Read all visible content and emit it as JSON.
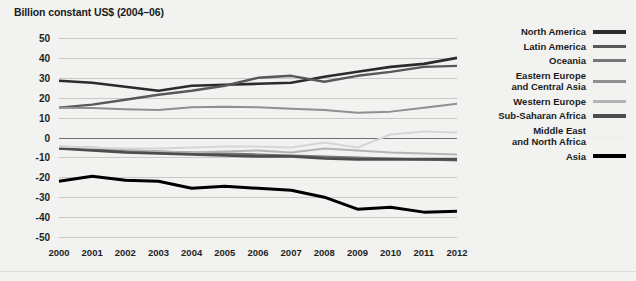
{
  "chart_data": {
    "type": "line",
    "title": "Billion constant US$ (2004–06)",
    "subtitle": "",
    "xlabel": "",
    "ylabel": "Billion constant US$ (2004–06)",
    "x": [
      2000,
      2001,
      2002,
      2003,
      2004,
      2005,
      2006,
      2007,
      2008,
      2009,
      2010,
      2011,
      2012
    ],
    "xtick_labels": [
      "2000",
      "2001",
      "2002",
      "2003",
      "2004",
      "2005",
      "2006",
      "2007",
      "2008",
      "2009",
      "2010",
      "2011",
      "2012"
    ],
    "ytick_labels": [
      "50",
      "40",
      "30",
      "20",
      "10",
      "0",
      "-10",
      "-20",
      "-30",
      "-40",
      "-50"
    ],
    "ytick_values": [
      50,
      40,
      30,
      20,
      10,
      0,
      -10,
      -20,
      -30,
      -40,
      -50
    ],
    "ylim": [
      -50,
      50
    ],
    "xlim": [
      2000,
      2012
    ],
    "grid": true,
    "legend_position": "right",
    "series": [
      {
        "name": "North America",
        "color": "#2b2b2b",
        "width": 2.6,
        "values": [
          28.5,
          27.5,
          25.5,
          23.5,
          26.0,
          26.5,
          27.0,
          27.5,
          30.5,
          33.0,
          35.5,
          37.0,
          40.0
        ]
      },
      {
        "name": "Latin America",
        "color": "#585858",
        "width": 2.4,
        "values": [
          15.0,
          16.5,
          19.0,
          21.5,
          23.5,
          26.0,
          30.0,
          31.0,
          28.0,
          31.0,
          33.0,
          35.5,
          36.0
        ]
      },
      {
        "name": "Oceania",
        "color": "#767676",
        "width": 2.0,
        "values": [
          -5.5,
          -6.0,
          -6.5,
          -7.0,
          -7.5,
          -8.0,
          -8.5,
          -9.0,
          -9.5,
          -10.0,
          -10.5,
          -11.0,
          -11.5
        ]
      },
      {
        "name": "Eastern Europe\nand Central Asia",
        "color": "#8f8f8f",
        "width": 2.0,
        "values": [
          15.0,
          14.8,
          14.2,
          13.8,
          15.2,
          15.5,
          15.2,
          14.5,
          13.8,
          12.5,
          13.0,
          15.0,
          17.0
        ]
      },
      {
        "name": "Western Europe",
        "color": "#b4b4b4",
        "width": 2.0,
        "values": [
          -4.5,
          -5.0,
          -6.0,
          -7.0,
          -7.5,
          -7.0,
          -6.5,
          -7.5,
          -5.5,
          -6.5,
          -7.5,
          -8.0,
          -8.5
        ]
      },
      {
        "name": "Sub-Saharan Africa",
        "color": "#4d4d4d",
        "width": 2.6,
        "values": [
          -5.5,
          -6.5,
          -7.5,
          -8.0,
          -8.5,
          -9.0,
          -9.5,
          -9.5,
          -10.5,
          -11.0,
          -11.0,
          -11.0,
          -11.0
        ]
      },
      {
        "name": "Middle East\nand North Africa",
        "color": "#d6d6d6",
        "width": 2.0,
        "values": [
          -4.5,
          -5.0,
          -5.5,
          -5.5,
          -5.0,
          -4.5,
          -4.5,
          -5.0,
          -2.5,
          -5.0,
          1.5,
          3.0,
          2.5
        ]
      },
      {
        "name": "Asia",
        "color": "#000000",
        "width": 3.0,
        "values": [
          -22.0,
          -19.5,
          -21.5,
          -22.0,
          -25.5,
          -24.5,
          -25.5,
          -26.5,
          -30.0,
          -36.0,
          -35.0,
          -37.5,
          -37.0
        ]
      }
    ]
  },
  "legend": {
    "entries": [
      {
        "label": "North America",
        "color": "#2b2b2b",
        "thick": true
      },
      {
        "label": "Latin America",
        "color": "#585858",
        "thick": false
      },
      {
        "label": "Oceania",
        "color": "#767676",
        "thick": false
      },
      {
        "label": "Eastern Europe\nand Central Asia",
        "color": "#8f8f8f",
        "thick": false
      },
      {
        "label": "Western Europe",
        "color": "#b4b4b4",
        "thick": false
      },
      {
        "label": "Sub-Saharan Africa",
        "color": "#4d4d4d",
        "thick": true
      },
      {
        "label": "Middle East\nand North Africa",
        "color": "#efefed",
        "thick": false
      },
      {
        "label": "Asia",
        "color": "#000000",
        "thick": true
      }
    ]
  },
  "colors": {
    "background": "#f2f2f0",
    "gridline": "#c9c9c7",
    "zero_line": "#6f6f6f",
    "text": "#1b1b1b"
  }
}
